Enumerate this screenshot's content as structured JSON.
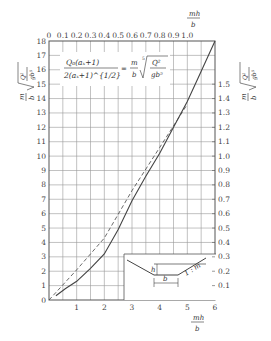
{
  "chart_data": {
    "type": "line",
    "title": "",
    "formula": {
      "lhs_num": "Q₀(aₓ+1)",
      "lhs_den": "2(aₓ+1)^{1/2}",
      "equals": "=",
      "rhs": "m/b · ⁵√(Q²/(g b⁵))"
    },
    "xlabel": "mh/b",
    "x2label": "mh/b",
    "ylabel": "m/b · ⁵√(Q²/(g b⁵))",
    "y2label": "m/b · ⁵√(Q²/(g b⁵))",
    "xlim": [
      0,
      6
    ],
    "ylim": [
      0,
      18
    ],
    "x2lim": [
      0,
      1.2
    ],
    "y2lim": [
      0,
      1.8
    ],
    "x_ticks": [
      "1",
      "2",
      "3",
      "4",
      "5",
      "6"
    ],
    "y_ticks": [
      "0",
      "1",
      "2",
      "3",
      "4",
      "5",
      "6",
      "7",
      "8",
      "9",
      "10",
      "11",
      "12",
      "13",
      "14",
      "15",
      "16",
      "17",
      "18"
    ],
    "x2_ticks": [
      "0",
      "0.1",
      "0.2",
      "0.3",
      "0.4",
      "0.5",
      "0.6",
      "0.7",
      "0.8",
      "0.9",
      "1.0"
    ],
    "y2_ticks": [
      "0.1",
      "0.2",
      "0.3",
      "0.4",
      "0.5",
      "0.6",
      "0.7",
      "0.8",
      "0.9",
      "1.0",
      "1.1",
      "1.2",
      "1.3",
      "1.4",
      "1.5"
    ],
    "grid": true,
    "series": [
      {
        "name": "solid curve",
        "style": "solid",
        "x": [
          0.25,
          0.6,
          1.0,
          1.5,
          2.0,
          2.5,
          3.0,
          3.5,
          4.0,
          4.5,
          5.0,
          5.5,
          6.0
        ],
        "y": [
          0.3,
          0.8,
          1.3,
          2.2,
          3.2,
          4.9,
          6.9,
          8.6,
          10.2,
          12.0,
          13.8,
          15.9,
          18.0
        ]
      },
      {
        "name": "dashed line",
        "style": "dashed",
        "x": [
          0.0,
          1.0,
          2.0,
          3.0,
          4.0,
          5.0
        ],
        "y": [
          0.0,
          2.1,
          4.3,
          7.6,
          10.6,
          13.6
        ]
      }
    ],
    "inset": {
      "type": "trapezoidal channel cross-section",
      "labels": {
        "depth": "h",
        "bottom": "b",
        "slope": "1 : m"
      }
    }
  }
}
